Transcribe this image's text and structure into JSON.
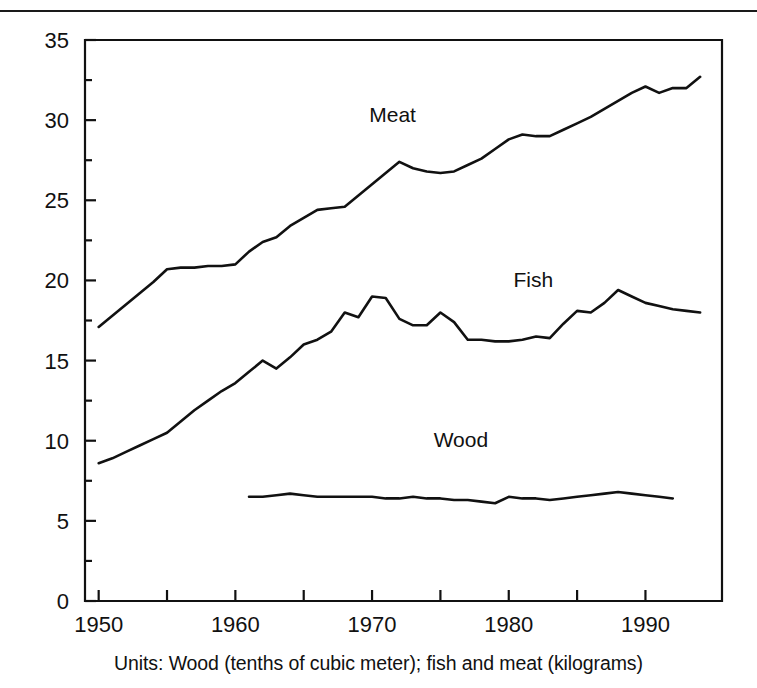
{
  "figure": {
    "caption": "Units: Wood (tenths of cubic meter); fish and meat (kilograms)",
    "top_rule": true,
    "ink_color": "#111111",
    "background_color": "#ffffff"
  },
  "axes": {
    "y_tick_labels": [
      "0",
      "5",
      "10",
      "15",
      "20",
      "25",
      "30",
      "35"
    ],
    "x_tick_labels": [
      "1950",
      "1960",
      "1970",
      "1980",
      "1990"
    ]
  },
  "series_labels": {
    "meat": "Meat",
    "fish": "Fish",
    "wood": "Wood"
  },
  "chart_data": {
    "type": "line",
    "title": "",
    "subtitle": "",
    "xlabel": "",
    "ylabel": "",
    "caption": "Units: Wood (tenths of cubic meter); fish and meat (kilograms)",
    "xlim": [
      1949.0,
      1995.6
    ],
    "ylim": [
      0,
      35
    ],
    "grid": false,
    "legend": "inline-labels",
    "x_major_ticks": [
      1950,
      1960,
      1970,
      1980,
      1990
    ],
    "x_minor_ticks": [
      1955,
      1965,
      1975,
      1985
    ],
    "x_tick_labels": [
      "1950",
      "1960",
      "1970",
      "1980",
      "1990"
    ],
    "y_major_ticks": [
      0,
      5,
      10,
      15,
      20,
      25,
      30,
      35
    ],
    "y_minor_ticks": [
      2.5,
      7.5,
      12.5,
      17.5,
      22.5,
      27.5,
      32.5
    ],
    "y_tick_labels": [
      "0",
      "5",
      "10",
      "15",
      "20",
      "25",
      "30",
      "35"
    ],
    "annotations": [
      {
        "text": "Meat",
        "x": 1971.5,
        "y": 29.9
      },
      {
        "text": "Fish",
        "x": 1981.8,
        "y": 19.6
      },
      {
        "text": "Wood",
        "x": 1976.5,
        "y": 9.6
      }
    ],
    "series": [
      {
        "name": "Meat",
        "x": [
          1950,
          1951,
          1952,
          1953,
          1954,
          1955,
          1956,
          1957,
          1958,
          1959,
          1960,
          1961,
          1962,
          1963,
          1964,
          1965,
          1966,
          1967,
          1968,
          1969,
          1970,
          1971,
          1972,
          1973,
          1974,
          1975,
          1976,
          1977,
          1978,
          1979,
          1980,
          1981,
          1982,
          1983,
          1984,
          1985,
          1986,
          1987,
          1988,
          1989,
          1990,
          1991,
          1992,
          1993,
          1994
        ],
        "values": [
          17.1,
          17.8,
          18.5,
          19.2,
          19.9,
          20.7,
          20.8,
          20.8,
          20.9,
          20.9,
          21.0,
          21.8,
          22.4,
          22.7,
          23.4,
          23.9,
          24.4,
          24.5,
          24.6,
          25.3,
          26.0,
          26.7,
          27.4,
          27.0,
          26.8,
          26.7,
          26.8,
          27.2,
          27.6,
          28.2,
          28.8,
          29.1,
          29.0,
          29.0,
          29.4,
          29.8,
          30.2,
          30.7,
          31.2,
          31.7,
          32.1,
          31.7,
          32.0,
          32.0,
          32.7
        ]
      },
      {
        "name": "Fish",
        "x": [
          1950,
          1951,
          1952,
          1953,
          1954,
          1955,
          1956,
          1957,
          1958,
          1959,
          1960,
          1961,
          1962,
          1963,
          1964,
          1965,
          1966,
          1967,
          1968,
          1969,
          1970,
          1971,
          1972,
          1973,
          1974,
          1975,
          1976,
          1977,
          1978,
          1979,
          1980,
          1981,
          1982,
          1983,
          1984,
          1985,
          1986,
          1987,
          1988,
          1989,
          1990,
          1991,
          1992,
          1993,
          1994
        ],
        "values": [
          8.6,
          8.9,
          9.3,
          9.7,
          10.1,
          10.5,
          11.2,
          11.9,
          12.5,
          13.1,
          13.6,
          14.3,
          15.0,
          14.5,
          15.2,
          16.0,
          16.3,
          16.8,
          18.0,
          17.7,
          19.0,
          18.9,
          17.6,
          17.2,
          17.2,
          18.0,
          17.4,
          16.3,
          16.3,
          16.2,
          16.2,
          16.3,
          16.5,
          16.4,
          17.3,
          18.1,
          18.0,
          18.6,
          19.4,
          19.0,
          18.6,
          18.4,
          18.2,
          18.1,
          18.0
        ]
      },
      {
        "name": "Wood",
        "x": [
          1961,
          1962,
          1963,
          1964,
          1965,
          1966,
          1967,
          1968,
          1969,
          1970,
          1971,
          1972,
          1973,
          1974,
          1975,
          1976,
          1977,
          1978,
          1979,
          1980,
          1981,
          1982,
          1983,
          1984,
          1985,
          1986,
          1987,
          1988,
          1989,
          1990,
          1991,
          1992
        ],
        "values": [
          6.5,
          6.5,
          6.6,
          6.7,
          6.6,
          6.5,
          6.5,
          6.5,
          6.5,
          6.5,
          6.4,
          6.4,
          6.5,
          6.4,
          6.4,
          6.3,
          6.3,
          6.2,
          6.1,
          6.5,
          6.4,
          6.4,
          6.3,
          6.4,
          6.5,
          6.6,
          6.7,
          6.8,
          6.7,
          6.6,
          6.5,
          6.4
        ]
      }
    ]
  }
}
